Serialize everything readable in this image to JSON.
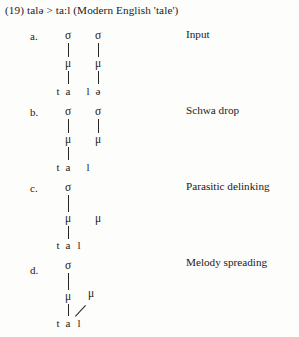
{
  "header": {
    "text": "(19) talə > ta:l (Modern English 'tale')"
  },
  "items": [
    {
      "letter": "a.",
      "process_label": "Input",
      "tiers": {
        "syllable": [
          "σ",
          "σ"
        ],
        "mora": [
          "μ",
          "μ"
        ],
        "segments": [
          "t",
          "a",
          "l",
          "ə"
        ]
      }
    },
    {
      "letter": "b.",
      "process_label": "Schwa drop",
      "tiers": {
        "syllable": [
          "σ",
          "σ"
        ],
        "mora": [
          "μ",
          "μ"
        ],
        "segments": [
          "t",
          "a",
          "l"
        ]
      }
    },
    {
      "letter": "c.",
      "process_label": "Parasitic delinking",
      "tiers": {
        "syllable": [
          "σ"
        ],
        "mora": [
          "μ",
          "μ"
        ],
        "segments": [
          "t",
          "a",
          "l"
        ]
      }
    },
    {
      "letter": "d.",
      "process_label": "Melody spreading",
      "tiers": {
        "syllable": [
          "σ"
        ],
        "mora": [
          "μ",
          "μ"
        ],
        "segments": [
          "t",
          "a",
          "l"
        ]
      }
    }
  ],
  "colors": {
    "ink": "#1a1a1a",
    "line": "#262626",
    "background": "#fdfdfc"
  }
}
